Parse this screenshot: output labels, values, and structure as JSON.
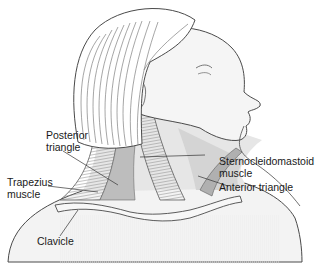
{
  "diagram": {
    "colors": {
      "background": "#ffffff",
      "line": "#555555",
      "skin": "#f2f2f2",
      "muscle": "#a8a8a8",
      "anterior_triangle": "#d9d9d9",
      "label_text": "#1a1a1a"
    },
    "labels": [
      {
        "id": "posterior-triangle",
        "lines": [
          "Posterior",
          "triangle"
        ]
      },
      {
        "id": "trapezius-muscle",
        "lines": [
          "Trapezius",
          "muscle"
        ]
      },
      {
        "id": "sternocleidomastoid-muscle",
        "lines": [
          "Sternocleidomastoid",
          "muscle"
        ]
      },
      {
        "id": "anterior-triangle",
        "lines": [
          "Anterior triangle"
        ]
      },
      {
        "id": "clavicle",
        "lines": [
          "Clavicle"
        ]
      }
    ]
  }
}
